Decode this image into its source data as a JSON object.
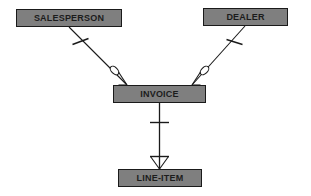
{
  "diagram": {
    "notation": "crows-foot",
    "background_color": "#ffffff",
    "entity_fill_color": "#7f7f7f",
    "entity_border_color": "#1a1a1a",
    "line_color": "#1a1a1a",
    "entities": [
      {
        "id": "salesperson",
        "label": "SALESPERSON"
      },
      {
        "id": "dealer",
        "label": "DEALER"
      },
      {
        "id": "invoice",
        "label": "INVOICE"
      },
      {
        "id": "lineitem",
        "label": "LINE-ITEM"
      }
    ],
    "relationships": [
      {
        "id": "salesperson-invoice",
        "from": "salesperson",
        "to": "invoice",
        "from_cardinality": "one-mandatory",
        "to_cardinality": "zero-or-many"
      },
      {
        "id": "dealer-invoice",
        "from": "dealer",
        "to": "invoice",
        "from_cardinality": "one-mandatory",
        "to_cardinality": "zero-or-many"
      },
      {
        "id": "invoice-lineitem",
        "from": "invoice",
        "to": "lineitem",
        "from_cardinality": "one-mandatory",
        "to_cardinality": "one-or-many"
      }
    ]
  }
}
